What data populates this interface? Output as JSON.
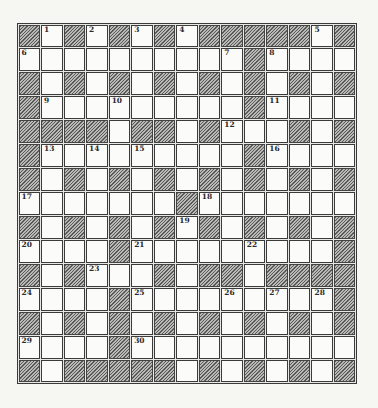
{
  "puzzle": {
    "rows": 15,
    "cols": 15,
    "legend": {
      "B": "blocked-cell",
      "W": "open-cell"
    },
    "grid": [
      "BWBWBWBWBBBBBWB",
      "WWWWWWWWWWBWWWW",
      "BWBWBWBWBWBWBWB",
      "BWWWWWWWWWBWWWW",
      "BBBBWBBWBWWWBWB",
      "BWWWWWWWWWBWWWW",
      "BWBWBWBWBWBWBWB",
      "WWWWWWWBWWWWWWW",
      "BWBWBWBWBWBWBWB",
      "WWWWBWWWWWWWWWB",
      "BWBWWWBWBBWBBBB",
      "WWWWBWWWWWWWWWB",
      "BWBWBWBWBWBWBWB",
      "WWWWBWWWWWWWWWW",
      "BWBBBBBWBWBWBWB"
    ],
    "numbers": [
      {
        "row": 0,
        "col": 1,
        "label": "1"
      },
      {
        "row": 0,
        "col": 3,
        "label": "2"
      },
      {
        "row": 0,
        "col": 5,
        "label": "3"
      },
      {
        "row": 0,
        "col": 7,
        "label": "4"
      },
      {
        "row": 0,
        "col": 13,
        "label": "5"
      },
      {
        "row": 1,
        "col": 0,
        "label": "6"
      },
      {
        "row": 1,
        "col": 9,
        "label": "7"
      },
      {
        "row": 1,
        "col": 11,
        "label": "8"
      },
      {
        "row": 3,
        "col": 1,
        "label": "9"
      },
      {
        "row": 3,
        "col": 4,
        "label": "10"
      },
      {
        "row": 3,
        "col": 11,
        "label": "11"
      },
      {
        "row": 4,
        "col": 9,
        "label": "12"
      },
      {
        "row": 5,
        "col": 1,
        "label": "13"
      },
      {
        "row": 5,
        "col": 3,
        "label": "14"
      },
      {
        "row": 5,
        "col": 5,
        "label": "15"
      },
      {
        "row": 5,
        "col": 11,
        "label": "16"
      },
      {
        "row": 7,
        "col": 0,
        "label": "17"
      },
      {
        "row": 7,
        "col": 8,
        "label": "18"
      },
      {
        "row": 8,
        "col": 7,
        "label": "19"
      },
      {
        "row": 9,
        "col": 0,
        "label": "20"
      },
      {
        "row": 9,
        "col": 5,
        "label": "21"
      },
      {
        "row": 9,
        "col": 10,
        "label": "22"
      },
      {
        "row": 10,
        "col": 3,
        "label": "23"
      },
      {
        "row": 11,
        "col": 0,
        "label": "24"
      },
      {
        "row": 11,
        "col": 5,
        "label": "25"
      },
      {
        "row": 11,
        "col": 9,
        "label": "26"
      },
      {
        "row": 11,
        "col": 11,
        "label": "27"
      },
      {
        "row": 11,
        "col": 13,
        "label": "28"
      },
      {
        "row": 13,
        "col": 0,
        "label": "29"
      },
      {
        "row": 13,
        "col": 5,
        "label": "30"
      }
    ],
    "colors": {
      "page_background": "#f6f6f3",
      "open_cell": "#fbfbf9",
      "block_hatch_dark": "#5a5a5a",
      "block_hatch_light": "#b9b9b5",
      "cell_border": "#3b3b3b",
      "number_text": "#2a2a2a"
    }
  }
}
